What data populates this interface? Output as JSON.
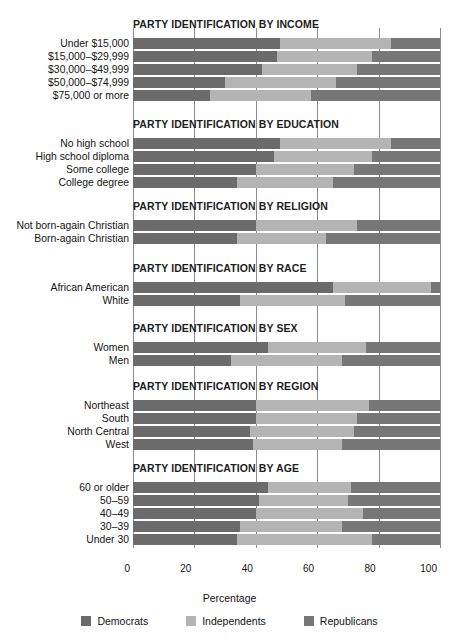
{
  "chart_data": {
    "type": "bar",
    "orientation": "horizontal",
    "stacked": true,
    "title": "",
    "xlabel": "Percentage",
    "ylabel": "",
    "xlim": [
      0,
      100
    ],
    "xticks": [
      0,
      20,
      40,
      60,
      80,
      100
    ],
    "grid": true,
    "legend_position": "bottom",
    "series": [
      {
        "name": "Democrats",
        "color": "#6b6b6b"
      },
      {
        "name": "Independents",
        "color": "#b4b4b4"
      },
      {
        "name": "Republicans",
        "color": "#777777"
      }
    ],
    "sections": [
      {
        "title": "PARTY IDENTIFICATION BY INCOME",
        "categories": [
          "Under $15,000",
          "$15,000–$29,999",
          "$30,000–$49,999",
          "$50,000–$74,999",
          "$75,000 or more"
        ],
        "values": [
          {
            "democrats": 48,
            "independents": 36,
            "republicans": 16
          },
          {
            "democrats": 47,
            "independents": 31,
            "republicans": 22
          },
          {
            "democrats": 42,
            "independents": 31,
            "republicans": 27
          },
          {
            "democrats": 30,
            "independents": 36,
            "republicans": 34
          },
          {
            "democrats": 25,
            "independents": 33,
            "republicans": 42
          }
        ]
      },
      {
        "title": "PARTY IDENTIFICATION BY EDUCATION",
        "categories": [
          "No high school",
          "High school diploma",
          "Some college",
          "College degree"
        ],
        "values": [
          {
            "democrats": 48,
            "independents": 36,
            "republicans": 16
          },
          {
            "democrats": 46,
            "independents": 32,
            "republicans": 22
          },
          {
            "democrats": 40,
            "independents": 32,
            "republicans": 28
          },
          {
            "democrats": 34,
            "independents": 31,
            "republicans": 35
          }
        ]
      },
      {
        "title": "PARTY IDENTIFICATION BY RELIGION",
        "categories": [
          "Not born-again Christian",
          "Born-again Christian"
        ],
        "values": [
          {
            "democrats": 40,
            "independents": 33,
            "republicans": 27
          },
          {
            "democrats": 34,
            "independents": 29,
            "republicans": 37
          }
        ]
      },
      {
        "title": "PARTY IDENTIFICATION BY RACE",
        "categories": [
          "African American",
          "White"
        ],
        "values": [
          {
            "democrats": 65,
            "independents": 32,
            "republicans": 3
          },
          {
            "democrats": 35,
            "independents": 34,
            "republicans": 31
          }
        ]
      },
      {
        "title": "PARTY IDENTIFICATION BY SEX",
        "categories": [
          "Women",
          "Men"
        ],
        "values": [
          {
            "democrats": 44,
            "independents": 32,
            "republicans": 24
          },
          {
            "democrats": 32,
            "independents": 36,
            "republicans": 32
          }
        ]
      },
      {
        "title": "PARTY IDENTIFICATION BY REGION",
        "categories": [
          "Northeast",
          "South",
          "North Central",
          "West"
        ],
        "values": [
          {
            "democrats": 40,
            "independents": 37,
            "republicans": 23
          },
          {
            "democrats": 40,
            "independents": 33,
            "republicans": 27
          },
          {
            "democrats": 38,
            "independents": 34,
            "republicans": 28
          },
          {
            "democrats": 39,
            "independents": 29,
            "republicans": 32
          }
        ]
      },
      {
        "title": "PARTY IDENTIFICATION BY AGE",
        "categories": [
          "60 or older",
          "50–59",
          "40–49",
          "30–39",
          "Under 30"
        ],
        "values": [
          {
            "democrats": 44,
            "independents": 27,
            "republicans": 29
          },
          {
            "democrats": 41,
            "independents": 29,
            "republicans": 30
          },
          {
            "democrats": 40,
            "independents": 35,
            "republicans": 25
          },
          {
            "democrats": 35,
            "independents": 33,
            "republicans": 32
          },
          {
            "democrats": 34,
            "independents": 44,
            "republicans": 22
          }
        ]
      }
    ]
  },
  "axis": {
    "xlabel": "Percentage",
    "ticks": [
      "0",
      "20",
      "40",
      "60",
      "80",
      "100"
    ]
  },
  "legend": {
    "items": [
      {
        "label": "Democrats",
        "color": "#6b6b6b"
      },
      {
        "label": "Independents",
        "color": "#b4b4b4"
      },
      {
        "label": "Republicans",
        "color": "#777777"
      }
    ]
  }
}
